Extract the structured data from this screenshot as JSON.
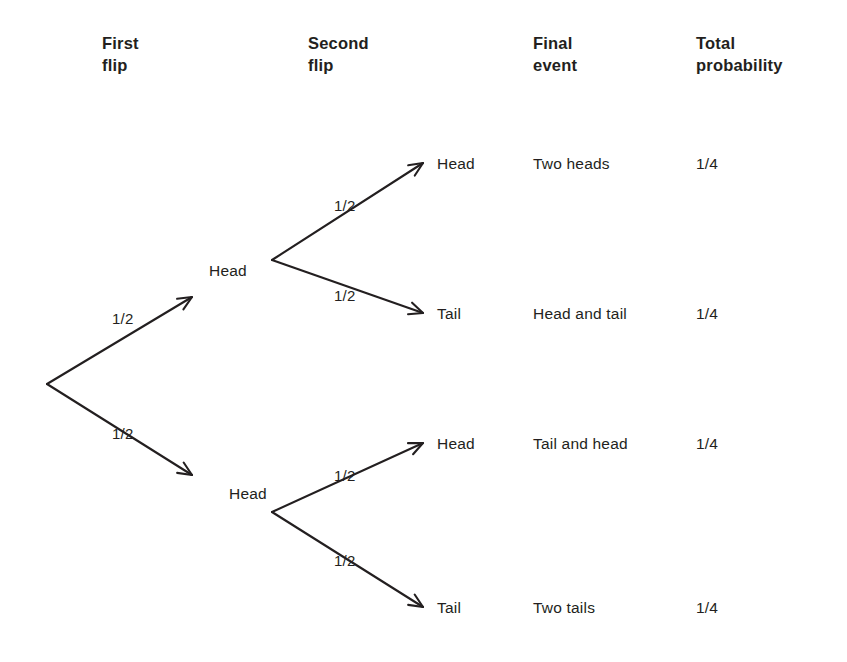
{
  "figure": {
    "type": "probability-tree-diagram",
    "background_color": "#ffffff",
    "ink_color": "#231f20"
  },
  "headers": [
    {
      "id": "first-flip",
      "line1": "First",
      "line2": "flip",
      "x": 102,
      "y": 32
    },
    {
      "id": "second-flip",
      "line1": "Second",
      "line2": "flip",
      "x": 308,
      "y": 32
    },
    {
      "id": "final-event",
      "line1": "Final",
      "line2": "event",
      "x": 533,
      "y": 32
    },
    {
      "id": "total-probability",
      "line1": "Total",
      "line2": "probability",
      "x": 696,
      "y": 32
    }
  ],
  "tree": {
    "root": {
      "x": 47,
      "y": 384
    },
    "level1": [
      {
        "id": "node-head-1",
        "label": "Head",
        "label_x": 209,
        "label_y": 262,
        "vertex_x": 272,
        "vertex_y": 260,
        "edge_prob": "1/2",
        "edge_prob_x": 112,
        "edge_prob_y": 310
      },
      {
        "id": "node-head-2",
        "label": "Head",
        "label_x": 229,
        "label_y": 485,
        "vertex_x": 272,
        "vertex_y": 512,
        "edge_prob": "1/2",
        "edge_prob_x": 112,
        "edge_prob_y": 425
      }
    ],
    "level2": [
      {
        "id": "leaf-1",
        "parent": "node-head-1",
        "label": "Head",
        "label_x": 437,
        "label_y": 155,
        "tip_x": 423,
        "tip_y": 163,
        "edge_prob": "1/2",
        "edge_prob_x": 334,
        "edge_prob_y": 197
      },
      {
        "id": "leaf-2",
        "parent": "node-head-1",
        "label": "Tail",
        "label_x": 437,
        "label_y": 305,
        "tip_x": 423,
        "tip_y": 313,
        "edge_prob": "1/2",
        "edge_prob_x": 334,
        "edge_prob_y": 287
      },
      {
        "id": "leaf-3",
        "parent": "node-head-2",
        "label": "Head",
        "label_x": 437,
        "label_y": 435,
        "tip_x": 423,
        "tip_y": 443,
        "edge_prob": "1/2",
        "edge_prob_x": 334,
        "edge_prob_y": 467
      },
      {
        "id": "leaf-4",
        "parent": "node-head-2",
        "label": "Tail",
        "label_x": 437,
        "label_y": 599,
        "tip_x": 423,
        "tip_y": 607,
        "edge_prob": "1/2",
        "edge_prob_x": 334,
        "edge_prob_y": 552
      }
    ]
  },
  "outcomes": [
    {
      "id": "outcome-1",
      "event": "Two heads",
      "probability": "1/4",
      "event_x": 533,
      "prob_x": 696,
      "y": 155
    },
    {
      "id": "outcome-2",
      "event": "Head and tail",
      "probability": "1/4",
      "event_x": 533,
      "prob_x": 696,
      "y": 305
    },
    {
      "id": "outcome-3",
      "event": "Tail and head",
      "probability": "1/4",
      "event_x": 533,
      "prob_x": 696,
      "y": 435
    },
    {
      "id": "outcome-4",
      "event": "Two tails",
      "probability": "1/4",
      "event_x": 533,
      "prob_x": 696,
      "y": 599
    }
  ],
  "chart_data": {
    "type": "diagram",
    "columns": [
      "First flip",
      "Second flip",
      "Final event",
      "Total probability"
    ],
    "branch_probability": "1/2",
    "paths": [
      {
        "first_flip": "Head",
        "second_flip": "Head",
        "final_event": "Two heads",
        "total_probability": "1/4"
      },
      {
        "first_flip": "Head",
        "second_flip": "Tail",
        "final_event": "Head and tail",
        "total_probability": "1/4"
      },
      {
        "first_flip": "Head",
        "second_flip": "Head",
        "final_event": "Tail and head",
        "total_probability": "1/4"
      },
      {
        "first_flip": "Head",
        "second_flip": "Tail",
        "final_event": "Two tails",
        "total_probability": "1/4"
      }
    ]
  }
}
